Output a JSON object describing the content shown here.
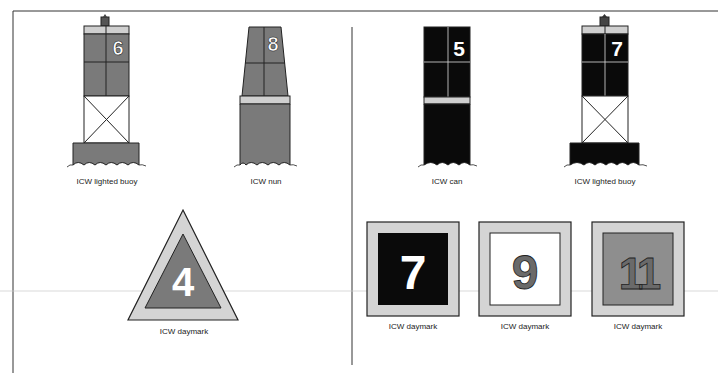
{
  "colors": {
    "red_fill": "#7a7a7a",
    "green_fill": "#0a0a0a",
    "light_band": "#cfcfcf",
    "daymark_border": "#d4d4d4",
    "outline": "#1a1a1a",
    "number_white": "#ffffff",
    "number_grey": "#6a6a6a"
  },
  "left_panel": {
    "side": "red (even numbers)",
    "items": [
      {
        "type": "lighted buoy",
        "number": "6",
        "caption": "ICW lighted buoy"
      },
      {
        "type": "nun",
        "number": "8",
        "caption": "ICW nun"
      },
      {
        "type": "triangular daymark",
        "number": "4",
        "caption": "ICW daymark"
      }
    ]
  },
  "right_panel": {
    "side": "green (odd numbers)",
    "items": [
      {
        "type": "can",
        "number": "5",
        "caption": "ICW can"
      },
      {
        "type": "lighted buoy",
        "number": "7",
        "caption": "ICW lighted buoy"
      },
      {
        "type": "square daymark (black)",
        "number": "7",
        "caption": "ICW daymark"
      },
      {
        "type": "square daymark (white)",
        "number": "9",
        "caption": "ICW daymark"
      },
      {
        "type": "square daymark (grey)",
        "number": "11",
        "caption": "ICW daymark"
      }
    ]
  }
}
